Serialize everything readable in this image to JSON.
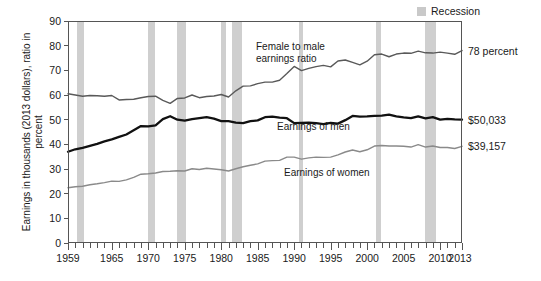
{
  "legend": {
    "swatch_name": "recession-swatch",
    "label": "Recession",
    "color": "#cfcfcf"
  },
  "axes": {
    "ylabel": "Earnings in thousands (2013 dollars), ratio in percent",
    "yticks": [
      "0",
      "10",
      "20",
      "30",
      "40",
      "50",
      "60",
      "70",
      "80",
      "90"
    ],
    "xticks": [
      "1959",
      "1965",
      "1970",
      "1975",
      "1980",
      "1985",
      "1990",
      "1995",
      "2000",
      "2005",
      "2010",
      "2013"
    ]
  },
  "annotations": {
    "ratio_note": "Female to male\nearnings ratio",
    "men_note": "Earnings of men",
    "women_note": "Earnings of women",
    "ratio_callout": "78 percent",
    "men_callout": "$50,033",
    "women_callout": "$39,157"
  },
  "chart_data": {
    "type": "line",
    "title": "",
    "xlabel": "",
    "ylabel": "Earnings in thousands (2013 dollars), ratio in percent",
    "xlim": [
      1959,
      2013
    ],
    "ylim": [
      0,
      90
    ],
    "grid": false,
    "legend_position": "top-right",
    "x": [
      1959,
      1960,
      1961,
      1962,
      1963,
      1964,
      1965,
      1966,
      1967,
      1968,
      1969,
      1970,
      1971,
      1972,
      1973,
      1974,
      1975,
      1976,
      1977,
      1978,
      1979,
      1980,
      1981,
      1982,
      1983,
      1984,
      1985,
      1986,
      1987,
      1988,
      1989,
      1990,
      1991,
      1992,
      1993,
      1994,
      1995,
      1996,
      1997,
      1998,
      1999,
      2000,
      2001,
      2002,
      2003,
      2004,
      2005,
      2006,
      2007,
      2008,
      2009,
      2010,
      2011,
      2012,
      2013
    ],
    "series": [
      {
        "name": "Female to male earnings ratio",
        "unit": "percent",
        "color": "#595959",
        "values": [
          60.5,
          60.0,
          59.5,
          59.8,
          59.7,
          59.5,
          59.8,
          58.0,
          58.2,
          58.3,
          58.9,
          59.4,
          59.5,
          57.8,
          56.6,
          58.6,
          58.8,
          60.0,
          58.9,
          59.4,
          59.6,
          60.2,
          59.2,
          61.7,
          63.6,
          63.7,
          64.6,
          65.2,
          65.2,
          66.0,
          68.7,
          71.6,
          69.9,
          70.8,
          71.5,
          72.0,
          71.4,
          73.8,
          74.2,
          73.2,
          72.2,
          73.7,
          76.3,
          76.6,
          75.5,
          76.6,
          77.0,
          76.9,
          77.8,
          77.1,
          77.0,
          77.4,
          77.0,
          76.5,
          78.0
        ]
      },
      {
        "name": "Earnings of men",
        "unit": "thousands of 2013 dollars",
        "color": "#111111",
        "values": [
          37.0,
          38.0,
          38.6,
          39.4,
          40.2,
          41.2,
          42.0,
          43.0,
          44.0,
          45.7,
          47.4,
          47.3,
          47.7,
          50.2,
          51.4,
          50.0,
          49.6,
          50.2,
          50.6,
          51.0,
          50.4,
          49.4,
          49.4,
          48.8,
          48.6,
          49.4,
          49.7,
          51.0,
          51.2,
          50.8,
          50.6,
          48.6,
          48.7,
          48.8,
          48.6,
          48.2,
          48.7,
          48.4,
          49.8,
          51.5,
          51.2,
          51.3,
          51.5,
          51.6,
          52.0,
          51.3,
          50.9,
          50.6,
          51.3,
          50.5,
          51.0,
          50.0,
          50.3,
          50.1,
          50.0
        ]
      },
      {
        "name": "Earnings of women",
        "unit": "thousands of 2013 dollars",
        "color": "#8a8a8a",
        "values": [
          22.4,
          22.8,
          23.0,
          23.6,
          24.0,
          24.5,
          25.1,
          25.0,
          25.6,
          26.6,
          27.9,
          28.1,
          28.4,
          29.0,
          29.1,
          29.3,
          29.2,
          30.1,
          29.8,
          30.3,
          30.0,
          29.7,
          29.2,
          30.1,
          30.9,
          31.5,
          32.1,
          33.2,
          33.4,
          33.5,
          34.8,
          34.8,
          34.0,
          34.5,
          34.8,
          34.7,
          34.8,
          35.7,
          36.9,
          37.7,
          37.0,
          37.8,
          39.3,
          39.5,
          39.3,
          39.3,
          39.2,
          38.9,
          39.9,
          38.9,
          39.3,
          38.7,
          38.7,
          38.3,
          39.2
        ]
      }
    ],
    "recessions": [
      {
        "start": 1960.3,
        "end": 1961.2
      },
      {
        "start": 1969.9,
        "end": 1970.9
      },
      {
        "start": 1973.9,
        "end": 1975.2
      },
      {
        "start": 1980.0,
        "end": 1980.6
      },
      {
        "start": 1981.5,
        "end": 1982.9
      },
      {
        "start": 1990.6,
        "end": 1991.2
      },
      {
        "start": 2001.2,
        "end": 2001.9
      },
      {
        "start": 2007.9,
        "end": 2009.5
      }
    ],
    "endpoint_labels": {
      "ratio": "78 percent",
      "men": "$50,033",
      "women": "$39,157"
    }
  }
}
